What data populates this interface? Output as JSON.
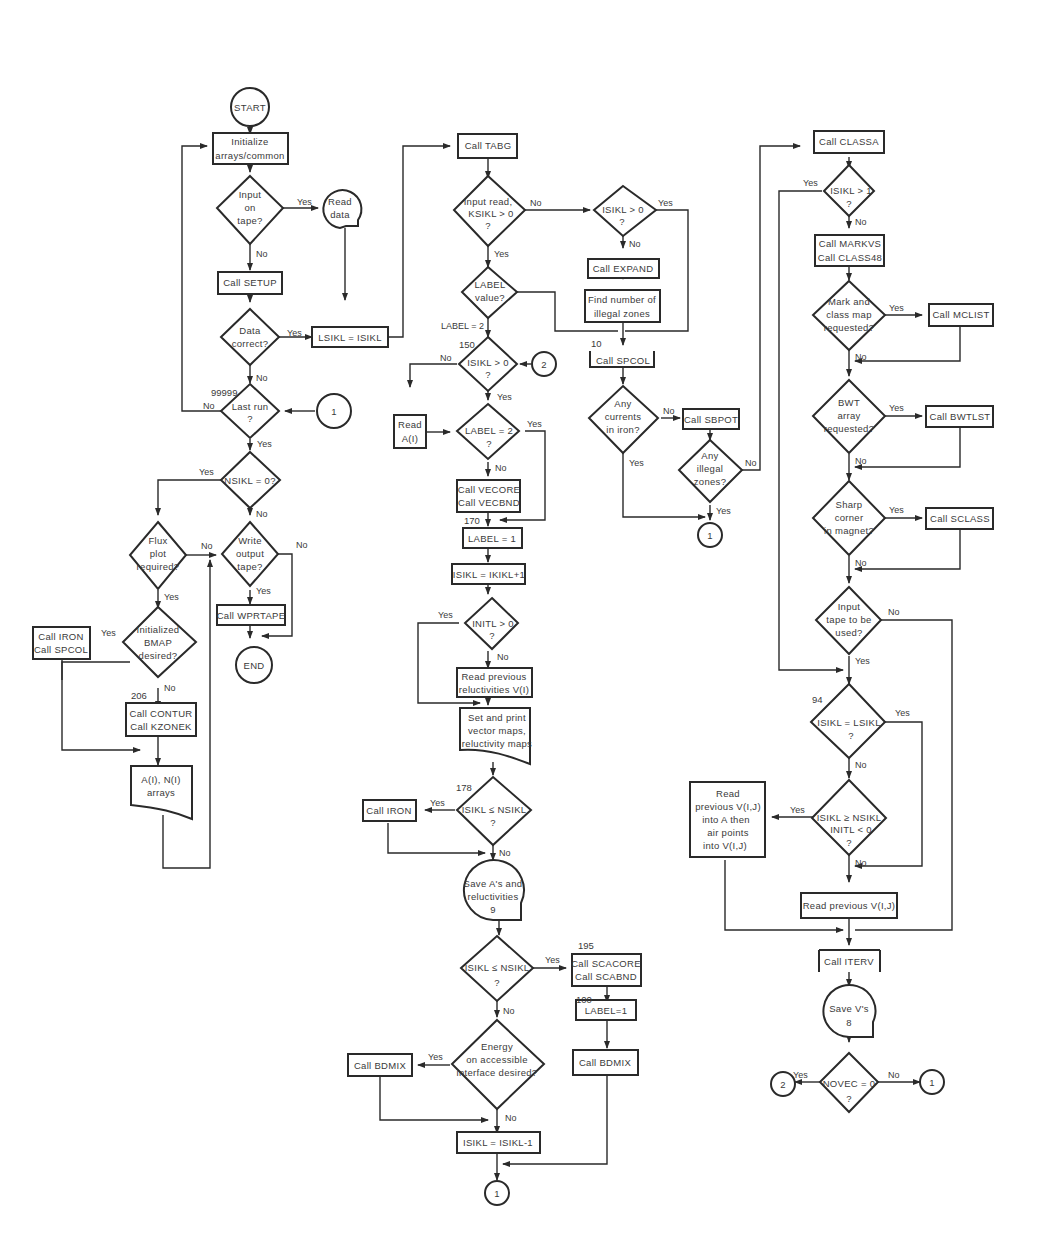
{
  "diagram": {
    "type": "flowchart",
    "nodes": {
      "start": {
        "text": [
          "START"
        ]
      },
      "init": {
        "text": [
          "Initialize",
          "arrays/common"
        ]
      },
      "input_tape": {
        "text": [
          "Input",
          "on",
          "tape?"
        ]
      },
      "read_data": {
        "text": [
          "Read",
          "data"
        ]
      },
      "setup": {
        "text": [
          "Call SETUP"
        ]
      },
      "data_correct": {
        "text": [
          "Data",
          "correct?"
        ]
      },
      "lsikl": {
        "text": [
          "LSIKL = ISIKL"
        ]
      },
      "last_run": {
        "text": [
          "Last run",
          "?"
        ]
      },
      "nsikl0": {
        "text": [
          "NSIKL = 0?"
        ]
      },
      "flux": {
        "text": [
          "Flux",
          "plot",
          "required?"
        ]
      },
      "write_tape": {
        "text": [
          "Write",
          "output",
          "tape?"
        ]
      },
      "wprtape": {
        "text": [
          "Call WPRTAPE"
        ]
      },
      "end": {
        "text": [
          "END"
        ]
      },
      "bmap": {
        "text": [
          "Initialized",
          "BMAP",
          "desired?"
        ]
      },
      "iron_spcol": {
        "text": [
          "Call IRON",
          "Call SPCOL"
        ]
      },
      "contur": {
        "text": [
          "Call CONTUR",
          "Call KZONEK"
        ]
      },
      "arrays_doc": {
        "text": [
          "A(I), N(I)",
          "arrays"
        ]
      },
      "tabg": {
        "text": [
          "Call TABG"
        ]
      },
      "input_read": {
        "text": [
          "Input read,",
          "KSIKL > 0",
          "?"
        ]
      },
      "label_value": {
        "text": [
          "LABEL",
          "value?"
        ]
      },
      "isikl_gt0_a": {
        "text": [
          "ISIKL > 0",
          "?"
        ]
      },
      "read_a": {
        "text": [
          "Read",
          "A(I)"
        ]
      },
      "label_eq2": {
        "text": [
          "LABEL = 2",
          "?"
        ]
      },
      "vecore": {
        "text": [
          "Call VECORE",
          "Call VECBND"
        ]
      },
      "label1": {
        "text": [
          "LABEL = 1"
        ]
      },
      "isikl_inc": {
        "text": [
          "ISIKL = IKIKL+1"
        ]
      },
      "initl": {
        "text": [
          "INITL > 0",
          "?"
        ]
      },
      "read_prev_rel": {
        "text": [
          "Read previous",
          "reluctivities V(I)"
        ]
      },
      "set_print": {
        "text": [
          "Set and print",
          "vector maps,",
          "reluctivity maps"
        ]
      },
      "isikl_le_nsikl_a": {
        "text": [
          "ISIKL ≤ NSIKL",
          "?"
        ]
      },
      "call_iron": {
        "text": [
          "Call IRON"
        ]
      },
      "save_a": {
        "text": [
          "Save A's and",
          "reluctivities",
          "9"
        ]
      },
      "isikl_le_nsikl_b": {
        "text": [
          "ISIKL ≤ NSIKL",
          "?"
        ]
      },
      "scacore": {
        "text": [
          "Call SCACORE",
          "Call SCABND"
        ]
      },
      "label1_b": {
        "text": [
          "LABEL=1"
        ]
      },
      "bdmix_r": {
        "text": [
          "Call BDMIX"
        ]
      },
      "energy": {
        "text": [
          "Energy",
          "on accessible",
          "interface desired?"
        ]
      },
      "bdmix_l": {
        "text": [
          "Call BDMIX"
        ]
      },
      "isikl_dec": {
        "text": [
          "ISIKL = ISIKL-1"
        ]
      },
      "isikl_gt0_b": {
        "text": [
          "ISIKL > 0",
          "?"
        ]
      },
      "expand": {
        "text": [
          "Call EXPAND"
        ]
      },
      "illegal_find": {
        "text": [
          "Find number of",
          "illegal zones"
        ]
      },
      "spcol": {
        "text": [
          "Call SPCOL"
        ]
      },
      "currents": {
        "text": [
          "Any",
          "currents",
          "in iron?"
        ]
      },
      "sbpot": {
        "text": [
          "Call SBPOT"
        ]
      },
      "illegal_any": {
        "text": [
          "Any",
          "illegal",
          "zones?"
        ]
      },
      "classa": {
        "text": [
          "Call CLASSA"
        ]
      },
      "isikl_gt1": {
        "text": [
          "ISIKL > 1",
          "?"
        ]
      },
      "markvs": {
        "text": [
          "Call MARKVS",
          "Call CLASS48"
        ]
      },
      "mark_class": {
        "text": [
          "Mark and",
          "class map",
          "requested?"
        ]
      },
      "mclist": {
        "text": [
          "Call MCLIST"
        ]
      },
      "bwt": {
        "text": [
          "BWT",
          "array",
          "requested?"
        ]
      },
      "bwtlst": {
        "text": [
          "Call BWTLST"
        ]
      },
      "sharp": {
        "text": [
          "Sharp",
          "corner",
          "in magnet?"
        ]
      },
      "sclass": {
        "text": [
          "Call SCLASS"
        ]
      },
      "input_tape_used": {
        "text": [
          "Input",
          "tape to be",
          "used?"
        ]
      },
      "isikl_eq_lsikl": {
        "text": [
          "ISIKL = LSIKL",
          "?"
        ]
      },
      "isikl_ge_nsikl": {
        "text": [
          "ISIKL ≥ NSIKL",
          "INITL < 0",
          "?"
        ]
      },
      "read_prev_vij_a": {
        "text": [
          "Read",
          "previous V(I,J)",
          "into A then",
          "air points",
          "into V(I,J)"
        ]
      },
      "read_prev_vij": {
        "text": [
          "Read previous V(I,J)"
        ]
      },
      "iterv": {
        "text": [
          "Call ITERV"
        ]
      },
      "save_v": {
        "text": [
          "Save V's",
          "8"
        ]
      },
      "novec": {
        "text": [
          "NOVEC = 0",
          "?"
        ]
      },
      "conn_1_a": {
        "text": [
          "1"
        ]
      },
      "conn_2_a": {
        "text": [
          "2"
        ]
      },
      "conn_1_b": {
        "text": [
          "1"
        ]
      },
      "conn_1_c": {
        "text": [
          "1"
        ]
      },
      "conn_2_b": {
        "text": [
          "2"
        ]
      },
      "conn_1_d": {
        "text": [
          "1"
        ]
      }
    },
    "edge_labels": {
      "yes": "Yes",
      "no": "No",
      "label2": "LABEL = 2"
    },
    "statement_numbers": {
      "n99999": "99999",
      "n206": "206",
      "n150": "150",
      "n170": "170",
      "n178": "178",
      "n195": "195",
      "n100": "100",
      "n10": "10",
      "n94": "94"
    }
  }
}
